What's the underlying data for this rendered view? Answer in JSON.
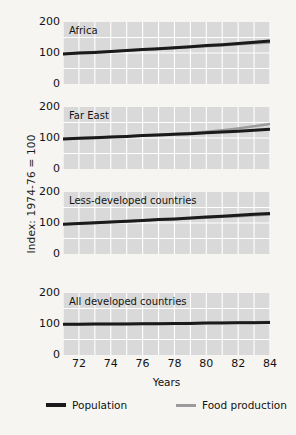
{
  "chart_data": {
    "type": "line",
    "title": "",
    "xlabel": "Years",
    "ylabel": "Index: 1974-76 = 100",
    "xlim": [
      71,
      84
    ],
    "ylim": [
      0,
      200
    ],
    "yticks": [
      200,
      100,
      0
    ],
    "xticks": [
      72,
      74,
      76,
      78,
      80,
      82,
      84
    ],
    "grid": true,
    "legend_position": "bottom",
    "legend": [
      {
        "name": "Population",
        "color": "#1a1a1a"
      },
      {
        "name": "Food production",
        "color": "#9b9b9b"
      }
    ],
    "panels": [
      {
        "label": "Africa",
        "x": [
          71,
          72,
          73,
          74,
          75,
          76,
          77,
          78,
          79,
          80,
          81,
          82,
          83,
          84
        ],
        "series": [
          {
            "name": "Population",
            "color": "#1a1a1a",
            "values": [
              97,
              100,
              102,
              105,
              108,
              111,
              114,
              117,
              120,
              124,
              127,
              131,
              135,
              139
            ]
          },
          {
            "name": "Food production",
            "color": "#9b9b9b",
            "values": [
              97,
              100,
              103,
              105,
              108,
              111,
              113,
              116,
              119,
              122,
              125,
              128,
              131,
              134
            ]
          }
        ]
      },
      {
        "label": "Far East",
        "x": [
          71,
          72,
          73,
          74,
          75,
          76,
          77,
          78,
          79,
          80,
          81,
          82,
          83,
          84
        ],
        "series": [
          {
            "name": "Population",
            "color": "#1a1a1a",
            "values": [
              97,
              99,
              101,
              103,
              105,
              108,
              110,
              112,
              114,
              117,
              119,
              122,
              125,
              128
            ]
          },
          {
            "name": "Food production",
            "color": "#9b9b9b",
            "values": [
              97,
              99,
              101,
              103,
              106,
              108,
              111,
              113,
              116,
              120,
              125,
              131,
              138,
              145
            ]
          }
        ]
      },
      {
        "label": "Less-developed countries",
        "x": [
          71,
          72,
          73,
          74,
          75,
          76,
          77,
          78,
          79,
          80,
          81,
          82,
          83,
          84
        ],
        "series": [
          {
            "name": "Population",
            "color": "#1a1a1a",
            "values": [
              96,
              98,
              101,
              103,
              106,
              108,
              111,
              113,
              116,
              119,
              122,
              125,
              128,
              131
            ]
          },
          {
            "name": "Food production",
            "color": "#9b9b9b",
            "values": [
              96,
              98,
              100,
              103,
              105,
              108,
              110,
              112,
              115,
              117,
              120,
              122,
              125,
              127
            ]
          }
        ]
      },
      {
        "label": "All developed countries",
        "x": [
          71,
          72,
          73,
          74,
          75,
          76,
          77,
          78,
          79,
          80,
          81,
          82,
          83,
          84
        ],
        "series": [
          {
            "name": "Population",
            "color": "#1a1a1a",
            "values": [
              99,
              99,
              100,
              100,
              100,
              101,
              101,
              102,
              102,
              103,
              103,
              104,
              104,
              105
            ]
          },
          {
            "name": "Food production",
            "color": "#9b9b9b",
            "values": [
              99,
              99,
              100,
              100,
              101,
              101,
              102,
              102,
              103,
              103,
              104,
              105,
              106,
              107
            ]
          }
        ]
      }
    ]
  },
  "axis": {
    "ylabel": "Index: 1974-76 = 100",
    "xlabel": "Years"
  },
  "panel_geometry": [
    {
      "top": 22,
      "height": 62
    },
    {
      "top": 107,
      "height": 62
    },
    {
      "top": 192,
      "height": 62
    },
    {
      "top": 293,
      "height": 62
    }
  ]
}
